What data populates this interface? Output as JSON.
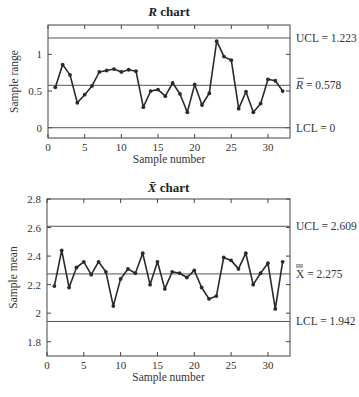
{
  "chart_data": [
    {
      "type": "line",
      "title": "R chart",
      "title_italic_prefix": "R",
      "title_suffix": " chart",
      "xlabel": "Sample number",
      "ylabel": "Sample range",
      "xlim": [
        0,
        33
      ],
      "ylim": [
        -0.14,
        1.4
      ],
      "xticks": [
        0,
        5,
        10,
        15,
        20,
        25,
        30
      ],
      "yticks": [
        0,
        0.5,
        1
      ],
      "ytick_labels": [
        "0",
        "0.5",
        "1"
      ],
      "grid": false,
      "x": [
        1,
        2,
        3,
        4,
        5,
        6,
        7,
        8,
        9,
        10,
        11,
        12,
        13,
        14,
        15,
        16,
        17,
        18,
        19,
        20,
        21,
        22,
        23,
        24,
        25,
        26,
        27,
        28,
        29,
        30,
        31,
        32
      ],
      "values": [
        0.55,
        0.86,
        0.72,
        0.34,
        0.45,
        0.57,
        0.76,
        0.78,
        0.8,
        0.76,
        0.79,
        0.77,
        0.28,
        0.5,
        0.52,
        0.43,
        0.61,
        0.46,
        0.21,
        0.59,
        0.31,
        0.47,
        1.18,
        0.97,
        0.92,
        0.26,
        0.49,
        0.21,
        0.33,
        0.66,
        0.64,
        0.5
      ],
      "control_lines": [
        {
          "name": "UCL",
          "value": 1.223,
          "label": "UCL = 1.223"
        },
        {
          "name": "center",
          "value": 0.578,
          "label": "R̄ = 0.578",
          "symbol": "R",
          "text": " = 0.578"
        },
        {
          "name": "LCL",
          "value": 0,
          "label": "LCL = 0"
        }
      ]
    },
    {
      "type": "line",
      "title": "X̄ chart",
      "title_italic_prefix": "X̄",
      "title_suffix": " chart",
      "xlabel": "Sample number",
      "ylabel": "Sample mean",
      "xlim": [
        0,
        33
      ],
      "ylim": [
        1.7,
        2.8
      ],
      "xticks": [
        0,
        5,
        10,
        15,
        20,
        25,
        30
      ],
      "yticks": [
        1.8,
        2.0,
        2.2,
        2.4,
        2.6,
        2.8
      ],
      "ytick_labels": [
        "1.8",
        "2",
        "2.2",
        "2.4",
        "2.6",
        "2.8"
      ],
      "grid": false,
      "x": [
        1,
        2,
        3,
        4,
        5,
        6,
        7,
        8,
        9,
        10,
        11,
        12,
        13,
        14,
        15,
        16,
        17,
        18,
        19,
        20,
        21,
        22,
        23,
        24,
        25,
        26,
        27,
        28,
        29,
        30,
        31,
        32
      ],
      "values": [
        2.19,
        2.44,
        2.18,
        2.32,
        2.36,
        2.27,
        2.36,
        2.29,
        2.05,
        2.24,
        2.31,
        2.28,
        2.42,
        2.2,
        2.36,
        2.17,
        2.29,
        2.28,
        2.25,
        2.3,
        2.18,
        2.1,
        2.12,
        2.39,
        2.37,
        2.31,
        2.42,
        2.2,
        2.28,
        2.35,
        2.03,
        2.36
      ],
      "control_lines": [
        {
          "name": "UCL",
          "value": 2.609,
          "label": "UCL = 2.609"
        },
        {
          "name": "center",
          "value": 2.275,
          "label": "X̿ = 2.275",
          "symbol": "X",
          "text": " = 2.275"
        },
        {
          "name": "LCL",
          "value": 1.942,
          "label": "LCL = 1.942"
        }
      ]
    }
  ],
  "layout": [
    {
      "left": 48,
      "right": 290,
      "top": 25,
      "bottom": 138,
      "title_y": 16,
      "xlabel_y": 163,
      "ylabel_x": 18
    },
    {
      "left": 47,
      "right": 290,
      "top": 199,
      "bottom": 356,
      "title_y": 192,
      "xlabel_y": 381,
      "ylabel_x": 17
    }
  ],
  "colors": {
    "line": "#2a2a2a",
    "axis": "#444444",
    "text": "#333333"
  }
}
